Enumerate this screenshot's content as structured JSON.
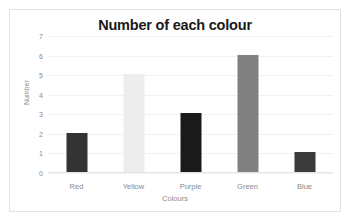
{
  "chart_data": {
    "type": "bar",
    "title": "Number of each colour",
    "xlabel": "Colours",
    "ylabel": "Number",
    "categories": [
      "Red",
      "Yellow",
      "Purple",
      "Green",
      "Blue"
    ],
    "values": [
      2,
      5,
      3,
      6,
      1
    ],
    "bar_colors": [
      "#333333",
      "#ededed",
      "#1a1a1a",
      "#808080",
      "#3a3a3a"
    ],
    "ylim": [
      0,
      7
    ],
    "yticks": [
      0,
      1,
      2,
      3,
      4,
      5,
      6,
      7
    ],
    "ytick_labels": [
      "0",
      "1",
      "2",
      "3",
      "4",
      "5",
      "6",
      "7"
    ],
    "grid": true,
    "legend": false,
    "frame_color": "#e2e2e2",
    "gridline_color": "#f1f1f1",
    "background": "#ffffff"
  }
}
